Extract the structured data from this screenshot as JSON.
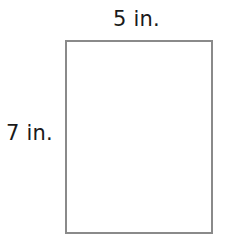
{
  "figure": {
    "shape": "rectangle",
    "width_label": "5 in.",
    "height_label": "7 in.",
    "border_color": "#8a8a8a"
  }
}
